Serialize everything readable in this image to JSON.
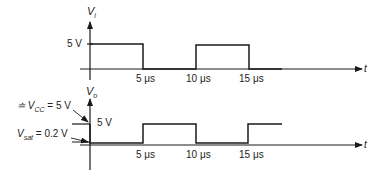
{
  "top_plot": {
    "y_axis_label": "V",
    "y_axis_subscript": "i",
    "x_axis_label": "t",
    "level_label": "5 V",
    "ticks": [
      "5 μs",
      "10 μs",
      "15 μs"
    ]
  },
  "bottom_plot": {
    "y_axis_label": "V",
    "y_axis_subscript": "o",
    "x_axis_label": "t",
    "level_label": "5 V",
    "vcc_prefix": "≐ V",
    "vcc_subscript": "CC",
    "vcc_value": "= 5 V",
    "vsat_label": "V",
    "vsat_subscript": "sat",
    "vsat_value": "= 0.2 V",
    "ticks": [
      "5 μs",
      "10 μs",
      "15 μs"
    ]
  },
  "colors": {
    "line": "#1a1a1a"
  }
}
